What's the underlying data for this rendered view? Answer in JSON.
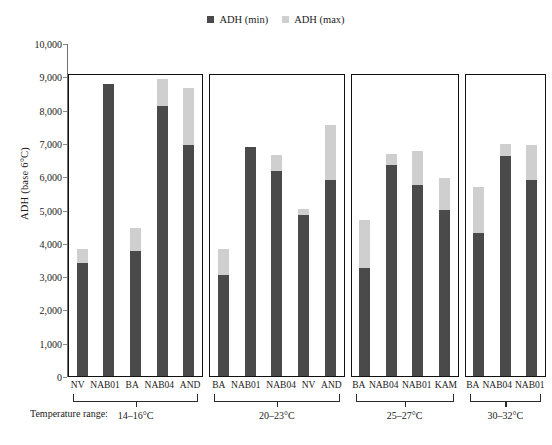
{
  "legend": {
    "items": [
      {
        "label": "ADH (min)",
        "color": "#4a4a4a",
        "key": "min"
      },
      {
        "label": "ADH (max)",
        "color": "#cfcfcf",
        "key": "max"
      }
    ]
  },
  "axis": {
    "y_label": "ADH (base 6°C)",
    "y_ticks": [
      "10,000",
      "9,000",
      "8,000",
      "7,000",
      "6,000",
      "5,000",
      "4,000",
      "3,000",
      "2,000",
      "1,000",
      "0"
    ],
    "y_tick_values": [
      10000,
      9000,
      8000,
      7000,
      6000,
      5000,
      4000,
      3000,
      2000,
      1000,
      0
    ]
  },
  "caption": {
    "temperature_prefix": "Temperature range:"
  },
  "colors": {
    "min_bar": "#4a4a4a",
    "max_bar": "#cfcfcf",
    "box_border": "#111111",
    "axis": "#6f6f6f"
  },
  "chart_data": {
    "type": "bar",
    "title": "",
    "xlabel": "",
    "ylabel": "ADH (base 6°C)",
    "ylim": [
      0,
      10000
    ],
    "grid": false,
    "legend_position": "top-center",
    "stacked": true,
    "note": "Each bar is a floating range: dark segment is ADH (min), light segment extends to ADH (max).",
    "series": [
      {
        "name": "ADH (min)",
        "color": "#4a4a4a"
      },
      {
        "name": "ADH (max)",
        "color": "#cfcfcf"
      }
    ],
    "groups": [
      {
        "range": "14–16°C",
        "categories": [
          "NV",
          "NAB01",
          "BA",
          "NAB04",
          "AND"
        ],
        "min": [
          3400,
          8760,
          3750,
          8120,
          6950
        ],
        "max": [
          3800,
          8760,
          4450,
          8920,
          8650
        ]
      },
      {
        "range": "20–23°C",
        "categories": [
          "BA",
          "NAB01",
          "NAB04",
          "NV",
          "AND"
        ],
        "min": [
          3020,
          6880,
          6150,
          4830,
          5900
        ],
        "max": [
          3800,
          6880,
          6650,
          5030,
          7550
        ]
      },
      {
        "range": "25–27°C",
        "categories": [
          "BA",
          "NAB04",
          "NAB01",
          "KAM"
        ],
        "min": [
          3250,
          6350,
          5730,
          5000
        ],
        "max": [
          4700,
          6680,
          6750,
          5950
        ]
      },
      {
        "range": "30–32°C",
        "categories": [
          "BA",
          "NAB04",
          "NAB01"
        ],
        "min": [
          4300,
          6620,
          5900
        ],
        "max": [
          5680,
          6980,
          6950
        ]
      }
    ]
  }
}
